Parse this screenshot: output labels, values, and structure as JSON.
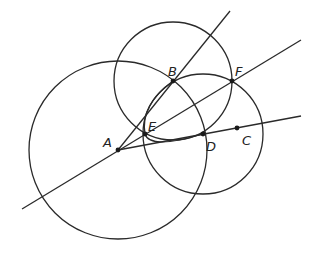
{
  "diagram": {
    "colors": {
      "stroke": "#2a2a2a",
      "point": "#1a1a1a",
      "label": "#222222",
      "background": "#ffffff"
    },
    "points": [
      {
        "id": "A",
        "label": "A",
        "x": 118,
        "y": 150,
        "lx": 103,
        "ly": 147
      },
      {
        "id": "B",
        "label": "B",
        "x": 173,
        "y": 81,
        "lx": 168,
        "ly": 76
      },
      {
        "id": "F",
        "label": "F",
        "x": 232,
        "y": 81,
        "lx": 235,
        "ly": 76
      },
      {
        "id": "E",
        "label": "E",
        "x": 145,
        "y": 134,
        "lx": 148,
        "ly": 131
      },
      {
        "id": "D",
        "label": "D",
        "x": 203,
        "y": 134,
        "lx": 206,
        "ly": 151
      },
      {
        "id": "C",
        "label": "C",
        "x": 237,
        "y": 128,
        "lx": 242,
        "ly": 145
      }
    ],
    "circles": [
      {
        "name": "circle-centered-A",
        "cx": 118,
        "cy": 150,
        "r": 89
      },
      {
        "name": "circle-centered-B",
        "cx": 173,
        "cy": 81,
        "r": 59
      },
      {
        "name": "circle-centered-D",
        "cx": 203,
        "cy": 134,
        "r": 60
      }
    ],
    "lines": [
      {
        "name": "ray-AB",
        "x1": 118,
        "y1": 150,
        "x2": 230,
        "y2": 11
      },
      {
        "name": "line-through-A-E-F",
        "x1": 22,
        "y1": 209,
        "x2": 301,
        "y2": 40
      },
      {
        "name": "ray-ADC",
        "x1": 118,
        "y1": 150,
        "x2": 301,
        "y2": 116
      }
    ],
    "arcs": [
      {
        "name": "arc-B-E-D",
        "d": "M 173 81 Q 140 105 145 134 Q 150 150 203 134"
      }
    ]
  }
}
